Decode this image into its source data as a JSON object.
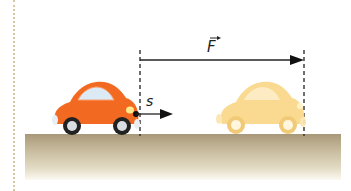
{
  "diagram": {
    "force_label": "F",
    "displacement_label": "s",
    "elements": {
      "car_start": {
        "color": "#f26a21",
        "description": "orange car at starting position"
      },
      "car_end": {
        "color": "#f8d27a",
        "description": "faded car at ending position"
      },
      "ground_color": "#a8987a",
      "force_arrow": {
        "from_x": 140,
        "to_x": 304,
        "y": 60
      },
      "displacement_arrow": {
        "from_x": 137,
        "to_x": 172,
        "y": 114
      }
    }
  }
}
